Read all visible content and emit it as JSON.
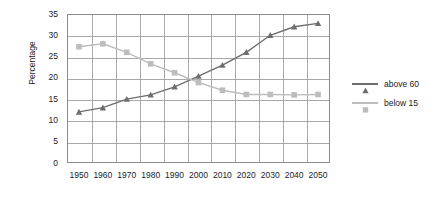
{
  "chart_data": {
    "type": "line",
    "title": "",
    "xlabel": "",
    "ylabel": "Percentage",
    "categories": [
      "1950",
      "1960",
      "1970",
      "1980",
      "1990",
      "2000",
      "2010",
      "2020",
      "2030",
      "2040",
      "2050"
    ],
    "x": [
      1950,
      1960,
      1970,
      1980,
      1990,
      2000,
      2010,
      2020,
      2030,
      2040,
      2050
    ],
    "xlim": [
      1945,
      2055
    ],
    "ylim": [
      0,
      35
    ],
    "yticks": [
      "0",
      "5",
      "10",
      "15",
      "20",
      "25",
      "30",
      "35"
    ],
    "ytick_values": [
      0,
      5,
      10,
      15,
      20,
      25,
      30,
      35
    ],
    "grid": true,
    "legend_position": "right",
    "series": [
      {
        "name": "above 60",
        "color": "#6e6e6e",
        "marker": "triangle",
        "values": [
          12,
          13,
          15,
          16,
          17.9,
          20.4,
          23,
          26,
          30,
          32,
          32.8
        ]
      },
      {
        "name": "below 15",
        "color": "#bdbdbd",
        "marker": "square",
        "values": [
          27.3,
          28,
          26,
          23.3,
          21.2,
          18.9,
          17.1,
          16.1,
          16.1,
          16,
          16.1
        ]
      }
    ]
  },
  "legend": {
    "items": [
      {
        "label": "above 60"
      },
      {
        "label": "below 15"
      }
    ]
  },
  "axes": {
    "y_title": "Percentage"
  },
  "colors": {
    "series_above_60": "#6e6e6e",
    "series_below_15": "#bdbdbd",
    "gridline": "#a8a8a8",
    "frame": "#8c8c8c",
    "text": "#222222",
    "background": "#ffffff"
  }
}
